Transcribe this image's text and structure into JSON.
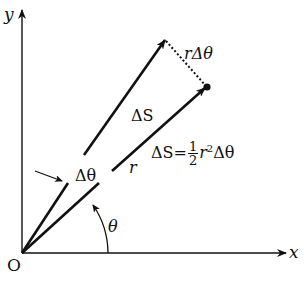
{
  "diagram": {
    "type": "polar-area-element",
    "axes": {
      "x_label": "x",
      "y_label": "y",
      "origin_label": "O"
    },
    "labels": {
      "radius": "r",
      "arc_length": "rΔθ",
      "area": "ΔS",
      "delta_theta": "Δθ",
      "theta": "θ",
      "formula_lhs": "ΔS",
      "formula_eq": "=",
      "formula_num": "1",
      "formula_den": "2",
      "formula_r": "r",
      "formula_exp": "2",
      "formula_tail": "Δθ"
    },
    "geometry": {
      "origin": [
        22,
        253
      ],
      "x_axis_end": [
        287,
        253
      ],
      "y_axis_end": [
        22,
        10
      ],
      "vector_upper_tip": [
        165,
        40
      ],
      "vector_lower_tip": [
        207,
        87
      ]
    },
    "colors": {
      "stroke": "#111111",
      "background": "#ffffff"
    }
  }
}
